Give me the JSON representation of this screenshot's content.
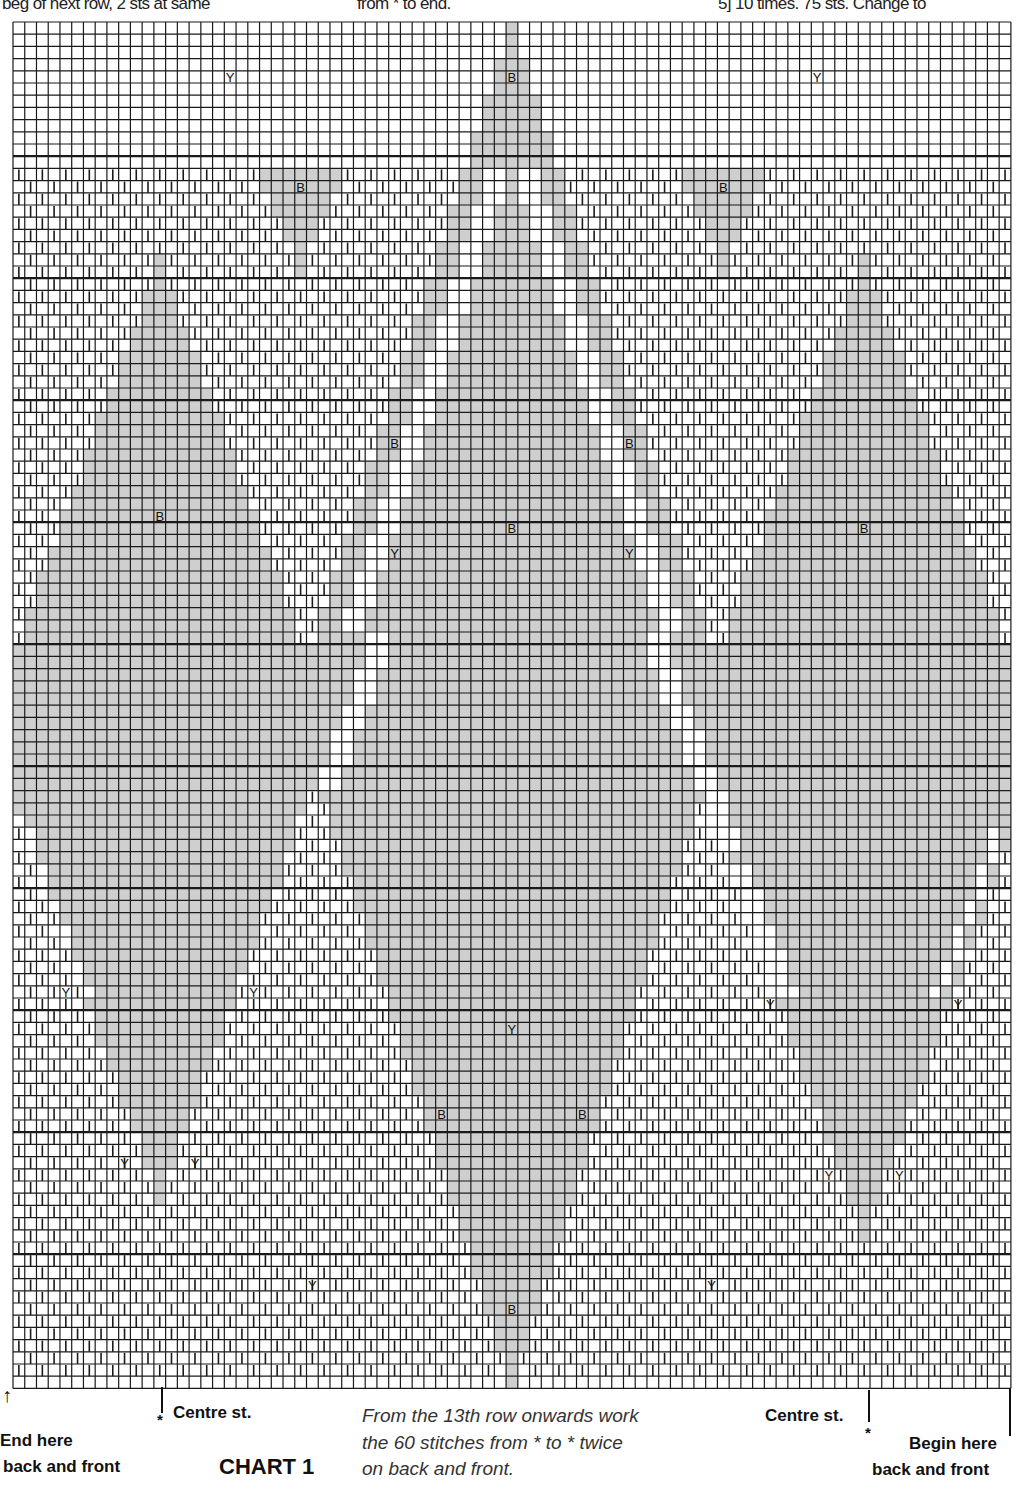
{
  "header_fragments": [
    {
      "text": "beg of next row, 2 sts at same",
      "x": 2
    },
    {
      "text": "from * to end.",
      "x": 357
    },
    {
      "text": "5] 10 times. 75 sts. Change to",
      "x": 718
    }
  ],
  "chart": {
    "title": "CHART 1",
    "cols": 85,
    "rows": 112,
    "origin": {
      "x": 13,
      "y": 22
    },
    "cell": {
      "w": 11.74,
      "h": 12.2
    },
    "heavy_row_lines": [
      11,
      21,
      31,
      41,
      51,
      61,
      71,
      81,
      91,
      101
    ],
    "colors": {
      "B": "#cfcfcf",
      "W": "#ffffff",
      "Y": "#ffffff",
      "grid": "#1a1a1a",
      "hatch": "#1a1a1a"
    },
    "legend": {
      "Y": "yellow (hatched squares)",
      "B": "blue-grey (shaded squares)",
      "W": "white (plain squares)"
    },
    "shapes": {
      "diamonds": [
        {
          "name": "left-diamond",
          "center_col": 12,
          "top_row": 19,
          "bottom_row": 96,
          "half_width": 14,
          "step_rows": 2.6
        },
        {
          "name": "center-diamond",
          "center_col": 42,
          "top_row": 0,
          "bottom_row": 111,
          "half_width": 30,
          "step_rows": 3.0
        },
        {
          "name": "right-diamond",
          "center_col": 72,
          "top_row": 19,
          "bottom_row": 99,
          "half_width": 14,
          "step_rows": 2.6
        }
      ],
      "top_triangles": [
        {
          "name": "left-small-triangle",
          "center_col": 24,
          "top_row": 12,
          "half_width": 3,
          "bottom_row": 20
        },
        {
          "name": "right-small-triangle",
          "center_col": 60,
          "top_row": 12,
          "half_width": 3,
          "bottom_row": 20
        }
      ]
    },
    "cell_labels": [
      {
        "t": "Y",
        "c": 18,
        "r": 4
      },
      {
        "t": "B",
        "c": 42,
        "r": 4
      },
      {
        "t": "Y",
        "c": 68,
        "r": 4
      },
      {
        "t": "B",
        "c": 24,
        "r": 13
      },
      {
        "t": "B",
        "c": 60,
        "r": 13
      },
      {
        "t": "B",
        "c": 32,
        "r": 34
      },
      {
        "t": "B",
        "c": 52,
        "r": 34
      },
      {
        "t": "B",
        "c": 12,
        "r": 40
      },
      {
        "t": "B",
        "c": 42,
        "r": 41
      },
      {
        "t": "B",
        "c": 72,
        "r": 41
      },
      {
        "t": "Y",
        "c": 32,
        "r": 43
      },
      {
        "t": "Y",
        "c": 52,
        "r": 43
      },
      {
        "t": "Y",
        "c": 4,
        "r": 79
      },
      {
        "t": "Y",
        "c": 20,
        "r": 79
      },
      {
        "t": "Y",
        "c": 64,
        "r": 80
      },
      {
        "t": "Y",
        "c": 80,
        "r": 80
      },
      {
        "t": "Y",
        "c": 42,
        "r": 82
      },
      {
        "t": "B",
        "c": 36,
        "r": 89
      },
      {
        "t": "B",
        "c": 48,
        "r": 89
      },
      {
        "t": "Y",
        "c": 9,
        "r": 93
      },
      {
        "t": "Y",
        "c": 15,
        "r": 93
      },
      {
        "t": "Y",
        "c": 69,
        "r": 94
      },
      {
        "t": "Y",
        "c": 75,
        "r": 94
      },
      {
        "t": "Y",
        "c": 25,
        "r": 103
      },
      {
        "t": "Y",
        "c": 59,
        "r": 103
      },
      {
        "t": "B",
        "c": 42,
        "r": 105
      }
    ]
  },
  "footer": {
    "end_here": "End here",
    "end_here_2": "back and front",
    "centre_left": "Centre st.",
    "centre_right": "Centre st.",
    "star": "*",
    "note_lines": [
      "From the 13th row onwards work",
      "the 60 stitches from * to * twice",
      "on back and front."
    ],
    "begin_here": "Begin here",
    "begin_here_2": "back and front",
    "arrow": "↑"
  }
}
